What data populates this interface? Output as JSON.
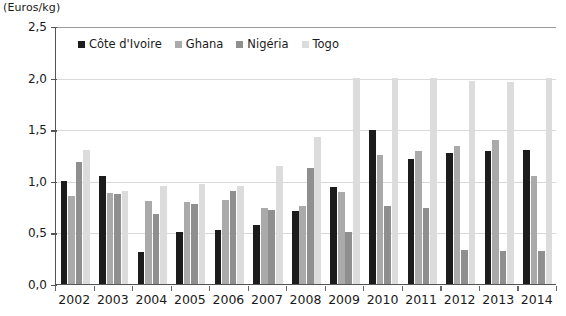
{
  "axis_unit_label": "(Euros/kg)",
  "legend": {
    "items": [
      {
        "label": "Côte d'Ivoire",
        "color": "#1c1c1c"
      },
      {
        "label": "Ghana",
        "color": "#aaaaaa"
      },
      {
        "label": "Nigéria",
        "color": "#8f8f8f"
      },
      {
        "label": "Togo",
        "color": "#dcdcdc"
      }
    ]
  },
  "yaxis": {
    "ticks": [
      "0,0",
      "0,5",
      "1,0",
      "1,5",
      "2,0",
      "2,5"
    ],
    "tick_values": [
      0,
      0.5,
      1.0,
      1.5,
      2.0,
      2.5
    ]
  },
  "chart_data": {
    "type": "bar",
    "title": "",
    "subtitle": "",
    "xlabel": "",
    "ylabel": "(Euros/kg)",
    "ylim": [
      0,
      2.5
    ],
    "ytick_step": 0.5,
    "grid": true,
    "legend_position": "top-inside-left",
    "categories": [
      "2002",
      "2003",
      "2004",
      "2005",
      "2006",
      "2007",
      "2008",
      "2009",
      "2010",
      "2011",
      "2012",
      "2013",
      "2014"
    ],
    "series": [
      {
        "name": "Côte d'Ivoire",
        "color": "#1c1c1c",
        "values": [
          1.0,
          1.05,
          0.31,
          0.5,
          0.52,
          0.57,
          0.71,
          0.94,
          1.49,
          1.21,
          1.27,
          1.29,
          1.3
        ]
      },
      {
        "name": "Ghana",
        "color": "#aaaaaa",
        "values": [
          0.85,
          0.88,
          0.8,
          0.79,
          0.81,
          0.74,
          0.76,
          0.89,
          1.25,
          1.29,
          1.34,
          1.4,
          1.05
        ]
      },
      {
        "name": "Nigéria",
        "color": "#8f8f8f",
        "values": [
          1.18,
          0.87,
          0.68,
          0.78,
          0.9,
          0.72,
          1.12,
          0.5,
          0.76,
          0.74,
          0.33,
          0.32,
          0.32
        ]
      },
      {
        "name": "Togo",
        "color": "#dcdcdc",
        "values": [
          1.3,
          0.9,
          0.95,
          0.97,
          0.95,
          1.14,
          1.42,
          2.0,
          2.0,
          2.0,
          1.97,
          1.96,
          2.0
        ]
      }
    ]
  }
}
